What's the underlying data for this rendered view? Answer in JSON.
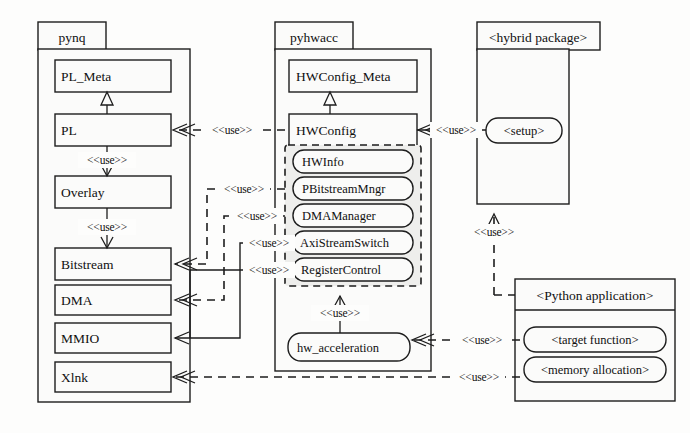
{
  "diagram": {
    "packages": [
      {
        "id": "pynq",
        "name": "pynq",
        "classes": [
          {
            "id": "pl_meta",
            "name": "PL_Meta"
          },
          {
            "id": "pl",
            "name": "PL"
          },
          {
            "id": "overlay",
            "name": "Overlay"
          },
          {
            "id": "bitstream",
            "name": "Bitstream"
          },
          {
            "id": "dma",
            "name": "DMA"
          },
          {
            "id": "mmio",
            "name": "MMIO"
          },
          {
            "id": "xlnk",
            "name": "Xlnk"
          }
        ]
      },
      {
        "id": "pyhwacc",
        "name": "pyhwacc",
        "classes": [
          {
            "id": "hwconfig_meta",
            "name": "HWConfig_Meta"
          },
          {
            "id": "hwconfig",
            "name": "HWConfig"
          }
        ],
        "group_members": [
          {
            "id": "hwinfo",
            "name": "HWInfo"
          },
          {
            "id": "pbitstreammngr",
            "name": "PBitstreamMngr"
          },
          {
            "id": "dmamanager",
            "name": "DMAManager"
          },
          {
            "id": "axistreamswitch",
            "name": "AxiStreamSwitch"
          },
          {
            "id": "registercontrol",
            "name": "RegisterControl"
          }
        ],
        "modules": [
          {
            "id": "hw_acceleration",
            "name": "hw_acceleration"
          }
        ]
      },
      {
        "id": "hybrid",
        "name": "<hybrid package>",
        "modules": [
          {
            "id": "setup",
            "name": "<setup>"
          }
        ]
      },
      {
        "id": "pyapp",
        "name": "<Python application>",
        "modules": [
          {
            "id": "target_function",
            "name": "<target function>"
          },
          {
            "id": "memory_allocation",
            "name": "<memory allocation>"
          }
        ]
      }
    ],
    "stereotype_use": "<<use>>",
    "relations": [
      {
        "from": "pl",
        "to": "pl_meta",
        "kind": "generalization",
        "label": ""
      },
      {
        "from": "hwconfig",
        "to": "hwconfig_meta",
        "kind": "generalization",
        "label": ""
      },
      {
        "from": "pl",
        "to": "overlay",
        "kind": "use-solid",
        "label": "<<use>>"
      },
      {
        "from": "overlay",
        "to": "bitstream",
        "kind": "use-solid",
        "label": "<<use>>"
      },
      {
        "from": "hwconfig",
        "to": "pl",
        "kind": "use-dashed",
        "label": "<<use>>"
      },
      {
        "from": "pbitstreammngr",
        "to": "bitstream",
        "kind": "use-dashed",
        "label": "<<use>>"
      },
      {
        "from": "dmamanager",
        "to": "dma",
        "kind": "use-dashed",
        "label": "<<use>>"
      },
      {
        "from": "axistreamswitch",
        "to": "mmio",
        "kind": "use-dashed",
        "label": "<<use>>"
      },
      {
        "from": "registercontrol",
        "to": "mmio",
        "kind": "use-dashed",
        "label": "<<use>>"
      },
      {
        "from": "hw_acceleration",
        "to": "group",
        "kind": "use-solid",
        "label": "<<use>>"
      },
      {
        "from": "setup",
        "to": "hwconfig",
        "kind": "use-solid",
        "label": "<<use>>"
      },
      {
        "from": "target_function",
        "to": "hw_acceleration",
        "kind": "use-dashed",
        "label": "<<use>>"
      },
      {
        "from": "memory_allocation",
        "to": "xlnk",
        "kind": "use-dashed",
        "label": "<<use>>"
      },
      {
        "from": "pyapp",
        "to": "hybrid",
        "kind": "use-dashed",
        "label": "<<use>>"
      }
    ],
    "colors": {
      "background": "#fdfdfc",
      "box_fill": "#fbfbfa",
      "group_fill": "#eeeeec",
      "stroke": "#1d1d1d",
      "text": "#101010"
    }
  }
}
